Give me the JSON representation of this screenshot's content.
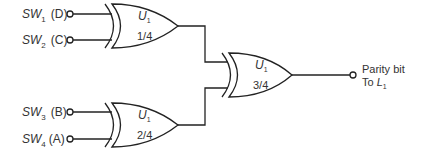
{
  "inputs": [
    {
      "name": "SW",
      "sub": "1",
      "signal": "(D)"
    },
    {
      "name": "SW",
      "sub": "2",
      "signal": "(C)"
    },
    {
      "name": "SW",
      "sub": "3",
      "signal": "(B)"
    },
    {
      "name": "SW",
      "sub": "4",
      "signal": "(A)"
    }
  ],
  "gates": [
    {
      "type": "XOR",
      "name": "U",
      "sub": "1",
      "fraction": "1/4"
    },
    {
      "type": "XOR",
      "name": "U",
      "sub": "1",
      "fraction": "2/4"
    },
    {
      "type": "XOR",
      "name": "U",
      "sub": "1",
      "fraction": "3/4"
    }
  ],
  "output": {
    "line1": "Parity bit",
    "line2_prefix": "To ",
    "line2_name": "L",
    "line2_sub": "1"
  }
}
